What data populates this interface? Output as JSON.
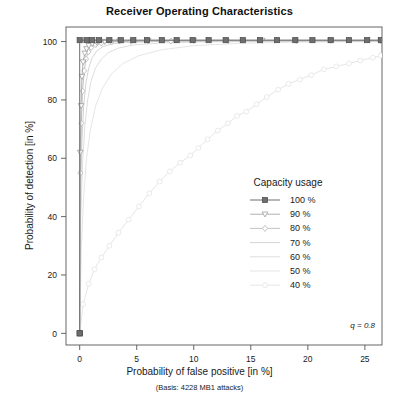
{
  "chart_data": {
    "type": "line",
    "title": "Receiver Operating Characteristics",
    "xlabel": "Probability of false positive [in %]",
    "xsublabel": "(Basis: 4228 MB1 attacks)",
    "ylabel": "Probability of detection [in %]",
    "xlim": [
      -1.2,
      26.5
    ],
    "ylim": [
      -4,
      105
    ],
    "xticks": [
      0,
      5,
      10,
      15,
      20,
      25
    ],
    "xticklabels": [
      "0",
      "5",
      "10",
      "15",
      "20",
      "25"
    ],
    "yticks": [
      0,
      20,
      40,
      60,
      80,
      100
    ],
    "yticklabels": [
      "0",
      "20",
      "40",
      "60",
      "80",
      "100"
    ],
    "grid": false,
    "annotation": "q = 0.8",
    "legend": {
      "title": "Capacity usage",
      "position": "center-right",
      "entries": [
        "100 %",
        "90 %",
        "80 %",
        "70 %",
        "60 %",
        "50 %",
        "40 %"
      ]
    },
    "series": [
      {
        "name": "100 %",
        "color": "#6e6e6e",
        "marker": "filled-square",
        "linewidth": 1.0,
        "points": [
          [
            0,
            0
          ],
          [
            0,
            100.5
          ],
          [
            0.6,
            100.5
          ],
          [
            1.1,
            100.5
          ],
          [
            1.7,
            100.5
          ],
          [
            2.6,
            100.5
          ],
          [
            3.6,
            100.5
          ],
          [
            4.7,
            100.5
          ],
          [
            5.9,
            100.5
          ],
          [
            7.2,
            100.5
          ],
          [
            8.5,
            100.5
          ],
          [
            9.9,
            100.5
          ],
          [
            11.3,
            100.5
          ],
          [
            12.8,
            100.5
          ],
          [
            14.3,
            100.5
          ],
          [
            15.8,
            100.5
          ],
          [
            17.3,
            100.5
          ],
          [
            18.9,
            100.5
          ],
          [
            20.4,
            100.5
          ],
          [
            22.0,
            100.5
          ],
          [
            23.6,
            100.5
          ],
          [
            25.2,
            100.5
          ],
          [
            26.4,
            100.5
          ]
        ]
      },
      {
        "name": "90 %",
        "color": "#a8a8a8",
        "marker": "open-triangle",
        "linewidth": 0.9,
        "points": [
          [
            0,
            0
          ],
          [
            0.05,
            62
          ],
          [
            0.12,
            78
          ],
          [
            0.2,
            88
          ],
          [
            0.3,
            93
          ],
          [
            0.45,
            96
          ],
          [
            0.6,
            97.5
          ],
          [
            0.8,
            98.6
          ],
          [
            1.1,
            99.3
          ],
          [
            1.5,
            99.7
          ],
          [
            2.2,
            100
          ],
          [
            3.5,
            100.2
          ],
          [
            6,
            100.3
          ],
          [
            10,
            100.4
          ],
          [
            16,
            100.4
          ],
          [
            22,
            100.4
          ],
          [
            26.4,
            100.4
          ]
        ]
      },
      {
        "name": "80 %",
        "color": "#bcbcbc",
        "marker": "open-diamond",
        "linewidth": 0.9,
        "points": [
          [
            0,
            0
          ],
          [
            0.06,
            55
          ],
          [
            0.15,
            72
          ],
          [
            0.25,
            83
          ],
          [
            0.4,
            90
          ],
          [
            0.55,
            94
          ],
          [
            0.75,
            96.5
          ],
          [
            1.0,
            98
          ],
          [
            1.4,
            99
          ],
          [
            1.9,
            99.5
          ],
          [
            2.8,
            99.9
          ],
          [
            4.5,
            100.1
          ],
          [
            8,
            100.2
          ],
          [
            13,
            100.3
          ],
          [
            19,
            100.3
          ],
          [
            26.4,
            100.3
          ]
        ]
      },
      {
        "name": "70 %",
        "color": "#cfcfcf",
        "marker": "none",
        "linewidth": 0.9,
        "points": [
          [
            0,
            0
          ],
          [
            0.08,
            48
          ],
          [
            0.2,
            66
          ],
          [
            0.35,
            78
          ],
          [
            0.55,
            86
          ],
          [
            0.8,
            91
          ],
          [
            1.1,
            94.5
          ],
          [
            1.5,
            96.8
          ],
          [
            2.0,
            98.2
          ],
          [
            2.8,
            99.2
          ],
          [
            4.0,
            99.7
          ],
          [
            6.5,
            100.0
          ],
          [
            11,
            100.1
          ],
          [
            17,
            100.2
          ],
          [
            26.4,
            100.2
          ]
        ]
      },
      {
        "name": "60 %",
        "color": "#dadada",
        "marker": "none",
        "linewidth": 0.9,
        "points": [
          [
            0,
            0
          ],
          [
            0.1,
            40
          ],
          [
            0.25,
            58
          ],
          [
            0.45,
            71
          ],
          [
            0.7,
            80
          ],
          [
            1.0,
            86.5
          ],
          [
            1.4,
            91
          ],
          [
            1.9,
            94
          ],
          [
            2.5,
            96.2
          ],
          [
            3.4,
            97.8
          ],
          [
            4.8,
            98.9
          ],
          [
            7,
            99.5
          ],
          [
            11,
            99.9
          ],
          [
            17,
            100.1
          ],
          [
            26.4,
            100.1
          ]
        ]
      },
      {
        "name": "50 %",
        "color": "#e2e2e2",
        "marker": "none",
        "linewidth": 0.9,
        "points": [
          [
            0,
            0
          ],
          [
            0.15,
            30
          ],
          [
            0.35,
            47
          ],
          [
            0.6,
            60
          ],
          [
            0.95,
            70
          ],
          [
            1.4,
            78
          ],
          [
            2.0,
            84
          ],
          [
            2.8,
            89
          ],
          [
            3.8,
            92.5
          ],
          [
            5.2,
            95.2
          ],
          [
            7.2,
            97.2
          ],
          [
            10,
            98.6
          ],
          [
            14,
            99.4
          ],
          [
            19,
            99.8
          ],
          [
            26.4,
            100.0
          ]
        ]
      },
      {
        "name": "40 %",
        "color": "#e6e6e6",
        "marker": "open-circle",
        "linewidth": 1.0,
        "points": [
          [
            0,
            0
          ],
          [
            0.3,
            10
          ],
          [
            0.8,
            17
          ],
          [
            1.3,
            22
          ],
          [
            1.9,
            26
          ],
          [
            2.6,
            30
          ],
          [
            3.4,
            34.5
          ],
          [
            4.3,
            39
          ],
          [
            5.2,
            43.5
          ],
          [
            6.1,
            48
          ],
          [
            7.0,
            52
          ],
          [
            7.9,
            55.5
          ],
          [
            8.8,
            58.5
          ],
          [
            9.7,
            61
          ],
          [
            10.4,
            63.5
          ],
          [
            11.2,
            66.5
          ],
          [
            12.1,
            69.5
          ],
          [
            13.0,
            72
          ],
          [
            13.8,
            74.5
          ],
          [
            14.6,
            76
          ],
          [
            15.5,
            78.5
          ],
          [
            16.4,
            81
          ],
          [
            17.4,
            83.5
          ],
          [
            18.3,
            85.5
          ],
          [
            19.3,
            87
          ],
          [
            20.3,
            88.5
          ],
          [
            21.4,
            90.5
          ],
          [
            22.5,
            91.5
          ],
          [
            23.6,
            92.5
          ],
          [
            24.6,
            93.5
          ],
          [
            25.7,
            94.5
          ],
          [
            26.4,
            95.2
          ]
        ]
      }
    ]
  }
}
